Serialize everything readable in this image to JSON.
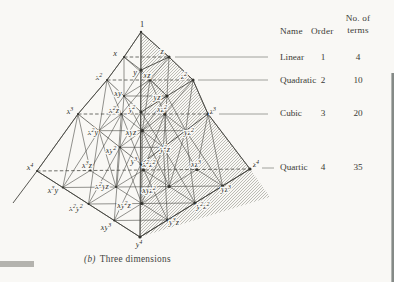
{
  "colors": {
    "paper": "#f9f8f5",
    "ink": "#3b3b35",
    "line": "#4a4a44",
    "hatch": "#8a8a80",
    "edge_artifact": "#787d7b",
    "smudge": "#9c9c96"
  },
  "diagram": {
    "apex": {
      "label": "1",
      "x": 142,
      "y": 24
    },
    "terms": [
      {
        "label": "x",
        "order": 1,
        "x": 115,
        "y": 53
      },
      {
        "label": "y",
        "order": 1,
        "x": 135,
        "y": 72
      },
      {
        "label": "z",
        "order": 1,
        "x": 162,
        "y": 51
      },
      {
        "label": "x^2",
        "order": 2,
        "x": 99,
        "y": 77
      },
      {
        "label": "xy",
        "order": 2,
        "x": 118,
        "y": 93
      },
      {
        "label": "y^2",
        "order": 2,
        "x": 132,
        "y": 109
      },
      {
        "label": "xz",
        "order": 2,
        "x": 147,
        "y": 75
      },
      {
        "label": "yz",
        "order": 2,
        "x": 157,
        "y": 97
      },
      {
        "label": "z^2",
        "order": 2,
        "x": 184,
        "y": 76
      },
      {
        "label": "x^3",
        "order": 3,
        "x": 70,
        "y": 111
      },
      {
        "label": "x^2y",
        "order": 3,
        "x": 93,
        "y": 132
      },
      {
        "label": "xy^2",
        "order": 3,
        "x": 111,
        "y": 150
      },
      {
        "label": "y^3",
        "order": 3,
        "x": 134,
        "y": 161
      },
      {
        "label": "x^2z",
        "order": 3,
        "x": 114,
        "y": 110
      },
      {
        "label": "xyz",
        "order": 3,
        "x": 131,
        "y": 132
      },
      {
        "label": "y^2z",
        "order": 3,
        "x": 165,
        "y": 149
      },
      {
        "label": "xz^2",
        "order": 3,
        "x": 162,
        "y": 109
      },
      {
        "label": "yz^2",
        "order": 3,
        "x": 189,
        "y": 132
      },
      {
        "label": "z^3",
        "order": 3,
        "x": 213,
        "y": 111
      },
      {
        "label": "x^4",
        "order": 4,
        "x": 30,
        "y": 167
      },
      {
        "label": "x^3y",
        "order": 4,
        "x": 53,
        "y": 190
      },
      {
        "label": "x^2y^2",
        "order": 4,
        "x": 76,
        "y": 208
      },
      {
        "label": "xy^3",
        "order": 4,
        "x": 106,
        "y": 227
      },
      {
        "label": "y^4",
        "order": 4,
        "x": 139,
        "y": 244
      },
      {
        "label": "x^3z",
        "order": 4,
        "x": 87,
        "y": 165
      },
      {
        "label": "x^2yz",
        "order": 4,
        "x": 102,
        "y": 186
      },
      {
        "label": "xy^2z",
        "order": 4,
        "x": 124,
        "y": 205
      },
      {
        "label": "y^3z",
        "order": 4,
        "x": 174,
        "y": 222
      },
      {
        "label": "x^2z^2",
        "order": 4,
        "x": 149,
        "y": 164
      },
      {
        "label": "xyz^2",
        "order": 4,
        "x": 149,
        "y": 190
      },
      {
        "label": "y^2z^2",
        "order": 4,
        "x": 203,
        "y": 206
      },
      {
        "label": "yz^3",
        "order": 4,
        "x": 226,
        "y": 189
      },
      {
        "label": "xz^3",
        "order": 4,
        "x": 196,
        "y": 164
      },
      {
        "label": "z^4",
        "order": 4,
        "x": 256,
        "y": 164
      }
    ],
    "slices": [
      {
        "k": 1,
        "X": [
          124,
          57
        ],
        "Y": [
          141,
          70
        ],
        "Z": [
          169,
          57
        ]
      },
      {
        "k": 2,
        "X": [
          107,
          80
        ],
        "Y": [
          141,
          112
        ],
        "Z": [
          193,
          80
        ]
      },
      {
        "k": 3,
        "X": [
          78,
          114
        ],
        "Y": [
          141,
          164
        ],
        "Z": [
          208,
          114
        ]
      },
      {
        "k": 4,
        "X": [
          37,
          171
        ],
        "Y": [
          140,
          237
        ],
        "Z": [
          250,
          169
        ]
      }
    ],
    "apex_point": [
      141,
      32
    ],
    "edges": [
      {
        "name": "edge-1-to-x4",
        "pts": [
          [
            141,
            32
          ],
          [
            124,
            57
          ],
          [
            107,
            80
          ],
          [
            78,
            114
          ],
          [
            37,
            171
          ],
          [
            13,
            203
          ]
        ],
        "w": 0.9
      },
      {
        "name": "edge-1-to-z4",
        "pts": [
          [
            141,
            32
          ],
          [
            169,
            57
          ],
          [
            193,
            80
          ],
          [
            208,
            114
          ],
          [
            250,
            169
          ]
        ],
        "w": 0.9
      },
      {
        "name": "edge-1-to-y4",
        "pts": [
          [
            141,
            32
          ],
          [
            140,
            237
          ]
        ],
        "w": 0.9
      },
      {
        "name": "edge-x4-to-y4",
        "pts": [
          [
            37,
            171
          ],
          [
            140,
            237
          ]
        ],
        "w": 0.9
      },
      {
        "name": "edge-y4-to-z4",
        "pts": [
          [
            140,
            237
          ],
          [
            250,
            169
          ]
        ],
        "w": 0.9
      }
    ],
    "hatch_polygon": [
      [
        141,
        32
      ],
      [
        169,
        57
      ],
      [
        193,
        80
      ],
      [
        208,
        114
      ],
      [
        250,
        169
      ],
      [
        270,
        197
      ],
      [
        140,
        237
      ]
    ]
  },
  "table": {
    "header": {
      "name": "Name",
      "order": "Order",
      "terms_line1": "No. of",
      "terms_line2": "terms"
    },
    "rows": [
      {
        "name": "Linear",
        "order": "1",
        "terms": "4",
        "line": [
          175,
          57,
          268,
          57
        ]
      },
      {
        "name": "Quadratic",
        "order": "2",
        "terms": "10",
        "line": [
          198,
          80,
          268,
          80
        ]
      },
      {
        "name": "Cubic",
        "order": "3",
        "terms": "20",
        "line": [
          219,
          114,
          268,
          114
        ]
      },
      {
        "name": "Quartic",
        "order": "4",
        "terms": "35",
        "line": [
          262,
          168,
          274,
          168
        ]
      }
    ]
  },
  "caption": {
    "prefix": "(b)",
    "text": "Three dimensions"
  }
}
